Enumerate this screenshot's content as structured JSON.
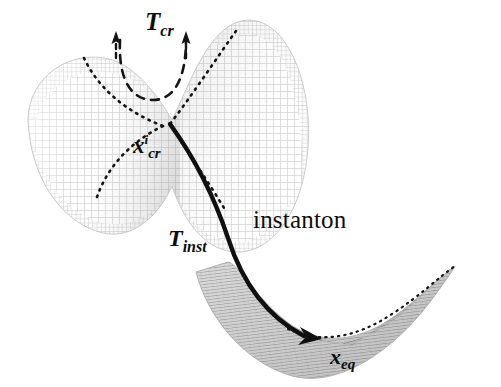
{
  "figure": {
    "background_color": "#ffffff",
    "ink_color": "#0d0d0d",
    "mesh_color_upper": "#d6d6d6",
    "mesh_color_lower": "#b4b4b4"
  },
  "labels": {
    "t_cr": {
      "base": "T",
      "sub": "cr",
      "full": "T_cr"
    },
    "x_cr": {
      "base": "x",
      "sup": "i",
      "sub": "cr",
      "full": "x^i_cr"
    },
    "t_inst": {
      "base": "T",
      "sub": "inst",
      "full": "T_inst"
    },
    "instanton": "instanton",
    "x_eq": {
      "base": "x",
      "sub": "eq",
      "full": "x_eq"
    }
  },
  "annotations": {
    "dashed_arc_name": "critical-mode-arc",
    "arrow_left_name": "t-cr-arrow-left",
    "arrow_right_name": "t-cr-arrow-right",
    "instanton_arrowhead": "instanton-arrowhead"
  }
}
